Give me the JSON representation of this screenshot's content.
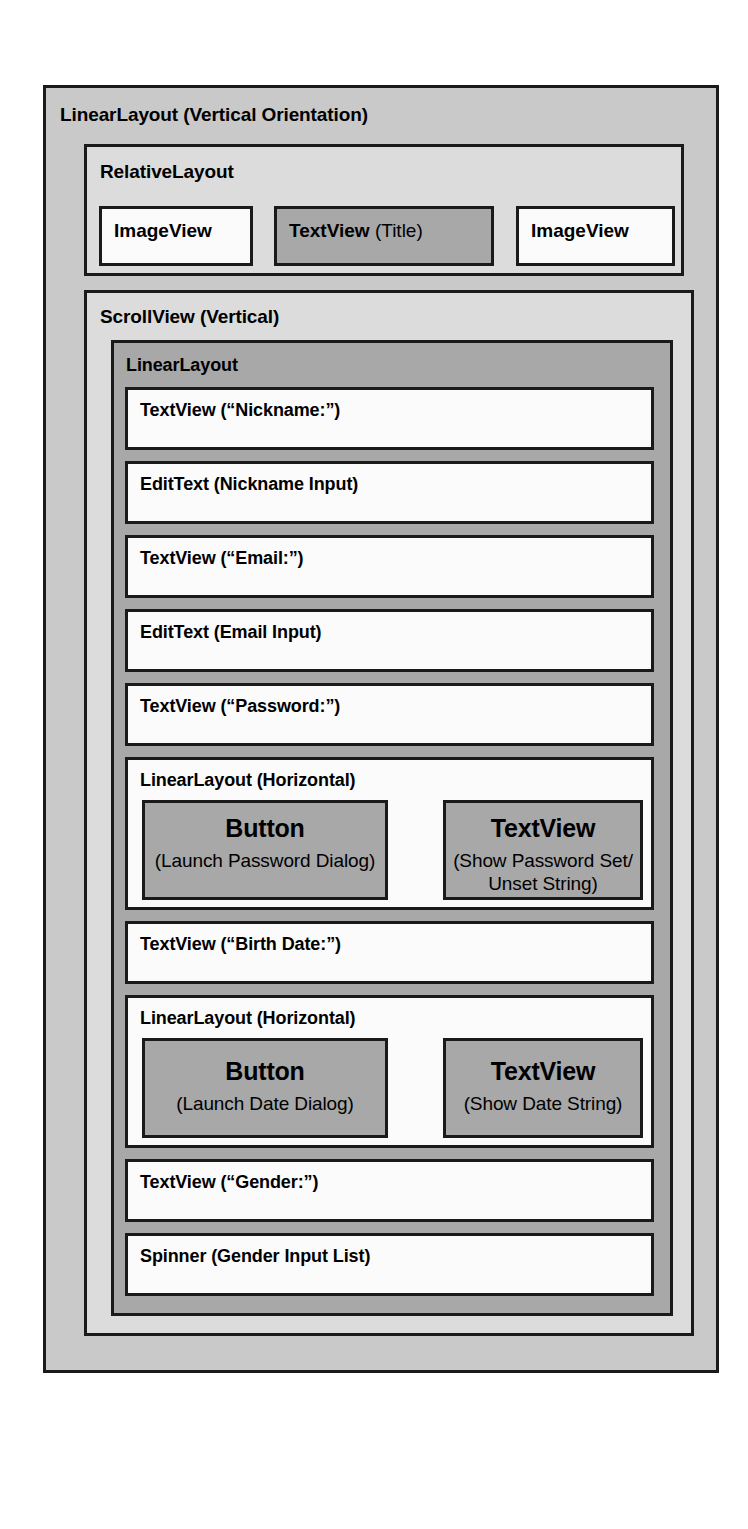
{
  "diagram": {
    "type": "android-view-hierarchy",
    "root": {
      "caption": "LinearLayout (Vertical Orientation)"
    },
    "header": {
      "caption": "RelativeLayout",
      "cells": [
        {
          "name": "ImageView",
          "kind": "ImageView",
          "label_strong": "ImageView",
          "label_light": "",
          "filled": false
        },
        {
          "name": "TextView (Title)",
          "kind": "TextView",
          "label_strong": "TextView",
          "label_light": " (Title)",
          "filled": true
        },
        {
          "name": "ImageView",
          "kind": "ImageView",
          "label_strong": "ImageView",
          "label_light": "",
          "filled": false
        }
      ]
    },
    "scrollview": {
      "caption": "ScrollView (Vertical)",
      "inner": {
        "caption": "LinearLayout",
        "rows": [
          {
            "label": "TextView (“Nickname:”)",
            "kind": "TextView"
          },
          {
            "label": "EditText (Nickname Input)",
            "kind": "EditText"
          },
          {
            "label": "TextView (“Email:”)",
            "kind": "TextView"
          },
          {
            "label": "EditText (Email Input)",
            "kind": "EditText"
          },
          {
            "label": "TextView (“Password:”)",
            "kind": "TextView"
          },
          {
            "label": "LinearLayout (Horizontal)",
            "kind": "LinearLayout",
            "children": [
              {
                "title": "Button",
                "subtitle": "(Launch Password Dialog)"
              },
              {
                "title": "TextView",
                "subtitle": "(Show Password Set/ Unset String)"
              }
            ]
          },
          {
            "label": "TextView (“Birth Date:”)",
            "kind": "TextView"
          },
          {
            "label": "LinearLayout (Horizontal)",
            "kind": "LinearLayout",
            "children": [
              {
                "title": "Button",
                "subtitle": "(Launch Date Dialog)"
              },
              {
                "title": "TextView",
                "subtitle": "(Show Date String)"
              }
            ]
          },
          {
            "label": "TextView (“Gender:”)",
            "kind": "TextView"
          },
          {
            "label": "Spinner (Gender Input List)",
            "kind": "Spinner"
          }
        ]
      }
    },
    "colors": {
      "outer_fill": "#c9c9c9",
      "light_fill": "#dcdcdc",
      "mid_fill": "#a8a8a8",
      "widget_fill": "#fbfbfb",
      "stroke": "#1a1a1a",
      "text": "#000000"
    }
  }
}
